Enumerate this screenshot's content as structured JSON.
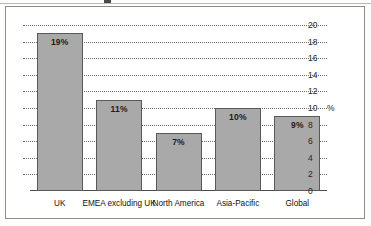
{
  "figure": {
    "background_color": "#ffffff",
    "border_color": "#8d8d8b",
    "bar_fill_color": "#a9a9a9",
    "bar_edge_color": "#595959",
    "gridline_color": "#6e6e6e"
  },
  "chart_data": {
    "type": "bar",
    "title": "",
    "xlabel": "",
    "ylabel": "%",
    "categories": [
      "UK",
      "EMEA excluding UK",
      "North America",
      "Asia-Pacific",
      "Global"
    ],
    "values": [
      19,
      11,
      7,
      10,
      9
    ],
    "data_labels": [
      "19%",
      "11%",
      "7%",
      "10%",
      "9%"
    ],
    "ylim": [
      0,
      20
    ],
    "ytick_values": [
      0,
      2,
      4,
      6,
      8,
      10,
      12,
      14,
      16,
      18,
      20
    ],
    "ytick_labels": [
      "0",
      "2",
      "4",
      "6",
      "8",
      "10",
      "12",
      "14",
      "16",
      "18",
      "20"
    ],
    "yaxis_position": "right",
    "unit_marker": "%",
    "unit_marker_at": 10,
    "grid": true,
    "grid_style": "dotted",
    "legend": "none"
  }
}
